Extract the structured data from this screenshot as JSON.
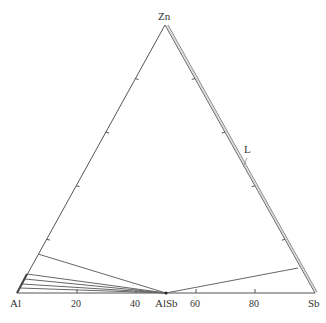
{
  "diagram": {
    "type": "ternary-phase-diagram",
    "vertices": {
      "top": "Zn",
      "left": "Al",
      "right": "Sb"
    },
    "compound": "AlSb",
    "bottom_axis_ticks": [
      "20",
      "40",
      "60",
      "80"
    ],
    "phase_label": "L",
    "colors": {
      "line": "#555555",
      "double_line": "#888888",
      "text": "#333333"
    }
  }
}
